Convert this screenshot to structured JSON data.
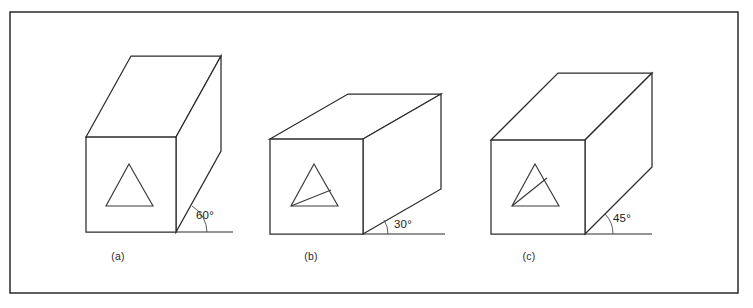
{
  "figure": {
    "background_color": "#ffffff",
    "line_color": "#2b2b2b",
    "frame": {
      "x": 10,
      "y": 12,
      "width": 728,
      "height": 281,
      "stroke": "#1a1a1a"
    }
  },
  "boxes": [
    {
      "id": "a",
      "caption": "(a)",
      "angle_label": "60°",
      "angle_degrees": 60,
      "caption_x": 118,
      "caption_y": 260,
      "angle_text_x": 196,
      "angle_text_y": 219,
      "front_face": {
        "left": 86,
        "top": 137,
        "right": 176,
        "bottom": 232
      },
      "depth_dx": 45,
      "depth_dy": -81,
      "ground_line": {
        "x1": 176,
        "y1": 232,
        "x2": 233,
        "y2": 232
      },
      "arc_path": "M 207 232 A 31 31 0 0 0 192 206",
      "face_outline": "M 86 137 L 176 137 L 176 232 L 86 232 Z",
      "top_face": "M 86 137 L 131 56 L 221 56 L 176 137 Z",
      "side_face": "M 176 137 L 221 56 L 221 151 L 176 232 Z",
      "triangle": "M 129 164 L 153 206 L 106 206 Z",
      "triangle_inner": ""
    },
    {
      "id": "b",
      "caption": "(b)",
      "angle_label": "30°",
      "angle_degrees": 30,
      "caption_x": 311,
      "caption_y": 260,
      "angle_text_x": 394,
      "angle_text_y": 228,
      "front_face": {
        "left": 270,
        "top": 139,
        "right": 363,
        "bottom": 234
      },
      "depth_dx": 78,
      "depth_dy": -45,
      "ground_line": {
        "x1": 363,
        "y1": 234,
        "x2": 445,
        "y2": 234
      },
      "arc_path": "M 388 234 A 25 25 0 0 0 384 220",
      "face_outline": "M 270 139 L 363 139 L 363 234 L 270 234 Z",
      "top_face": "M 270 139 L 348 94 L 441 94 L 363 139 Z",
      "side_face": "M 363 139 L 441 94 L 441 189 L 363 234 Z",
      "triangle": "M 314 164 L 338 206 L 291 206 Z",
      "triangle_inner": "M 291 206 L 331 190"
    },
    {
      "id": "c",
      "caption": "(c)",
      "angle_label": "45°",
      "angle_degrees": 45,
      "caption_x": 529,
      "caption_y": 260,
      "angle_text_x": 613,
      "angle_text_y": 222,
      "front_face": {
        "left": 491,
        "top": 140,
        "right": 585,
        "bottom": 234
      },
      "depth_dx": 67,
      "depth_dy": -67,
      "ground_line": {
        "x1": 585,
        "y1": 234,
        "x2": 652,
        "y2": 234
      },
      "arc_path": "M 613 234 A 28 28 0 0 0 605 214",
      "face_outline": "M 491 140 L 585 140 L 585 234 L 491 234 Z",
      "top_face": "M 491 140 L 558 73 L 652 73 L 585 140 Z",
      "side_face": "M 585 140 L 652 73 L 652 167 L 585 234 Z",
      "triangle": "M 535 164 L 559 206 L 512 206 Z",
      "triangle_inner": "M 512 206 L 547 178"
    }
  ]
}
